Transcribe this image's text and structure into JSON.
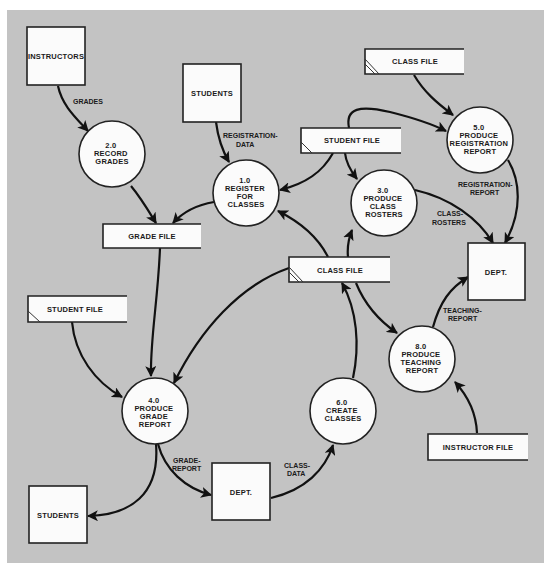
{
  "diagram": {
    "type": "data-flow-diagram",
    "external_entities": [
      {
        "id": "instructors",
        "label": "INSTRUCTORS"
      },
      {
        "id": "students_top",
        "label": "STUDENTS"
      },
      {
        "id": "dept_right",
        "label": "DEPT."
      },
      {
        "id": "dept_bottom",
        "label": "DEPT."
      },
      {
        "id": "students_bottom",
        "label": "STUDENTS"
      }
    ],
    "processes": [
      {
        "id": "p1",
        "number": "1.0",
        "lines": [
          "REGISTER",
          "FOR",
          "CLASSES"
        ]
      },
      {
        "id": "p2",
        "number": "2.0",
        "lines": [
          "RECORD",
          "GRADES"
        ]
      },
      {
        "id": "p3",
        "number": "3.0",
        "lines": [
          "PRODUCE",
          "CLASS",
          "ROSTERS"
        ]
      },
      {
        "id": "p4",
        "number": "4.0",
        "lines": [
          "PRODUCE",
          "GRADE",
          "REPORT"
        ]
      },
      {
        "id": "p5",
        "number": "5.0",
        "lines": [
          "PRODUCE",
          "REGISTRATION",
          "REPORT"
        ]
      },
      {
        "id": "p6",
        "number": "6.0",
        "lines": [
          "CREATE",
          "CLASSES"
        ]
      },
      {
        "id": "p8",
        "number": "8.0",
        "lines": [
          "PRODUCE",
          "TEACHING",
          "REPORT"
        ]
      }
    ],
    "data_stores": [
      {
        "id": "grade_file",
        "label": "GRADE FILE",
        "duplicate_mark": false
      },
      {
        "id": "class_file_top",
        "label": "CLASS FILE",
        "duplicate_mark": true
      },
      {
        "id": "student_file_top",
        "label": "STUDENT FILE",
        "duplicate_mark": true
      },
      {
        "id": "class_file_mid",
        "label": "CLASS FILE",
        "duplicate_mark": true
      },
      {
        "id": "student_file_left",
        "label": "STUDENT FILE",
        "duplicate_mark": true
      },
      {
        "id": "instructor_file",
        "label": "INSTRUCTOR FILE",
        "duplicate_mark": false
      }
    ],
    "flows": [
      {
        "from": "instructors",
        "to": "p2",
        "label": [
          "GRADES"
        ]
      },
      {
        "from": "students_top",
        "to": "p1",
        "label": [
          "REGISTRATION-",
          "DATA"
        ]
      },
      {
        "from": "p2",
        "to": "grade_file",
        "label": []
      },
      {
        "from": "p1",
        "to": "grade_file",
        "label": []
      },
      {
        "from": "student_file_top",
        "to": "p1",
        "label": []
      },
      {
        "from": "student_file_top",
        "to": "p3",
        "label": []
      },
      {
        "from": "student_file_top",
        "to": "p5",
        "label": []
      },
      {
        "from": "class_file_top",
        "to": "p5",
        "label": []
      },
      {
        "from": "p5",
        "to": "dept_right",
        "label": [
          "REGISTRATION-",
          "REPORT"
        ]
      },
      {
        "from": "p3",
        "to": "dept_right",
        "label": [
          "CLASS-",
          "ROSTERS"
        ]
      },
      {
        "from": "class_file_mid",
        "to": "p1",
        "label": []
      },
      {
        "from": "class_file_mid",
        "to": "p3",
        "label": []
      },
      {
        "from": "class_file_mid",
        "to": "p4",
        "label": []
      },
      {
        "from": "class_file_mid",
        "to": "p8",
        "label": []
      },
      {
        "from": "grade_file",
        "to": "p4",
        "label": []
      },
      {
        "from": "student_file_left",
        "to": "p4",
        "label": []
      },
      {
        "from": "p8",
        "to": "dept_right",
        "label": [
          "TEACHING-",
          "REPORT"
        ]
      },
      {
        "from": "instructor_file",
        "to": "p8",
        "label": []
      },
      {
        "from": "p6",
        "to": "class_file_mid",
        "label": []
      },
      {
        "from": "p4",
        "to": "dept_bottom",
        "label": [
          "GRADE-",
          "REPORT"
        ]
      },
      {
        "from": "p4",
        "to": "students_bottom",
        "label": []
      },
      {
        "from": "dept_bottom",
        "to": "p6",
        "label": [
          "CLASS-",
          "DATA"
        ]
      }
    ]
  },
  "colors": {
    "background": "#c3c3c3",
    "shape_fill": "#fbfbfb",
    "stroke": "#111111"
  }
}
